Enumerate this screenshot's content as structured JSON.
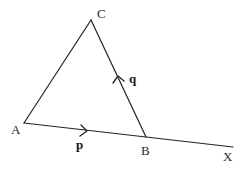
{
  "diagram": {
    "type": "geometry-vectors",
    "points": {
      "A": {
        "label": "A",
        "x": 24,
        "y": 123
      },
      "B": {
        "label": "B",
        "x": 146,
        "y": 137
      },
      "C": {
        "label": "C",
        "x": 91,
        "y": 20
      },
      "X": {
        "label": "X",
        "x": 233,
        "y": 147
      }
    },
    "segments": [
      {
        "from": "A",
        "to": "C"
      },
      {
        "from": "C",
        "to": "B"
      },
      {
        "from": "A",
        "to": "X"
      }
    ],
    "vectors": [
      {
        "name": "p",
        "label": "p",
        "on": "AB",
        "direction": "A to B"
      },
      {
        "name": "q",
        "label": "q",
        "on": "BC",
        "direction": "B to C"
      }
    ]
  },
  "labels": {
    "A": "A",
    "B": "B",
    "C": "C",
    "X": "X",
    "p": "p",
    "q": "q"
  }
}
